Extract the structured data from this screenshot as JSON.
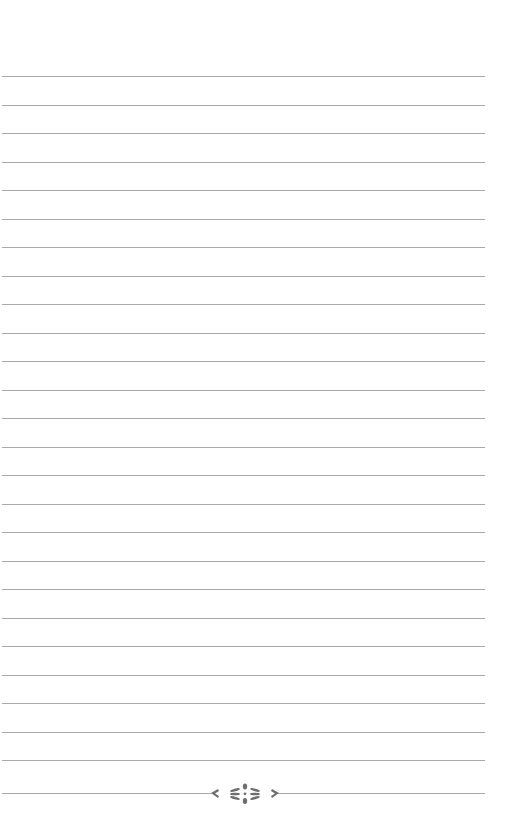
{
  "page": {
    "type": "lined-notebook-page",
    "background_color": "#ffffff",
    "line_color": "#9a9a9a",
    "ornament_color": "#6e6e6e",
    "line_count": 25,
    "first_line_y": 76,
    "line_spacing": 28.5,
    "line_left": 2,
    "line_width": 483
  },
  "footer": {
    "ornament_icon": "floral-divider-icon",
    "ornament_line_y": 793
  }
}
